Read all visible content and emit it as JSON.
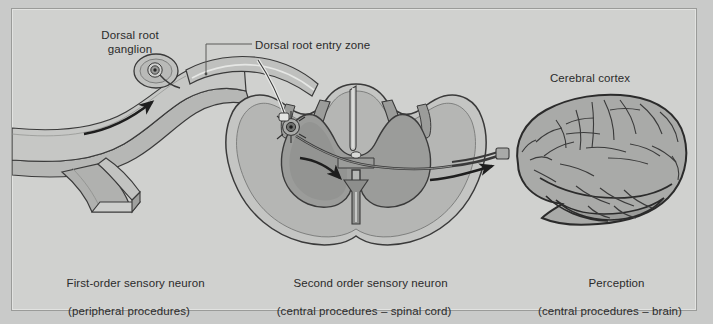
{
  "figure": {
    "kind": "anatomical-diagram",
    "background_color": "#c9cac9",
    "panel_color": "#d0d1cf",
    "frame_border_color": "#9a9b99",
    "ink_color": "#2b2b2b"
  },
  "labels": {
    "dorsal_root_ganglion": "Dorsal root\nganglion",
    "dorsal_root_entry_zone": "Dorsal root entry zone",
    "cerebral_cortex": "Cerebral cortex"
  },
  "captions": {
    "first_order": {
      "line1": "First-order sensory neuron",
      "line2": "(peripheral procedures)"
    },
    "second_order": {
      "line1": "Second order sensory neuron",
      "line2": "(central procedures – spinal cord)"
    },
    "perception": {
      "line1": "Perception",
      "line2": "(central procedures – brain)"
    }
  },
  "structures": {
    "peripheral_nerve": "peripheral-nerve-trunk",
    "nerve_branch_cut_end": "cut-nerve-end",
    "dorsal_root_ganglion_cell": "pseudounipolar-neuron-cell-body",
    "dorsal_root": "dorsal-root",
    "spinal_cord": "spinal-cord-cross-section",
    "white_matter": "white-matter",
    "gray_matter": "gray-matter-butterfly",
    "central_canal": "central-canal",
    "dorsal_median_sulcus": "dorsal-median-sulcus",
    "ventral_median_fissure": "ventral-median-fissure",
    "second_order_neuron_cell": "second-order-neuron-cell-body",
    "decussating_tract": "decussating-spinothalamic-tract",
    "ascending_tract": "ascending-tract-to-brain",
    "brain": "cerebral-hemisphere-lateral-view"
  },
  "arrows": [
    {
      "name": "afferent-conduction-arrow",
      "direction": "right",
      "region": "peripheral-nerve"
    },
    {
      "name": "decussation-arrow",
      "direction": "down-right",
      "region": "spinal-cord-gray-matter"
    },
    {
      "name": "ascending-to-cortex-arrow",
      "direction": "right",
      "region": "tract-to-brain"
    }
  ],
  "palette": {
    "white_matter_light": "#c4c5c3",
    "white_matter_mid": "#b4b5b3",
    "gray_matter": "#9b9c9a",
    "nerve_sheath": "#a9aaa8",
    "nerve_core": "#bcbdbb",
    "brain_fill": "#a9aaa8",
    "outline": "#3a3a3a",
    "highlight": "#e3e4e2"
  }
}
